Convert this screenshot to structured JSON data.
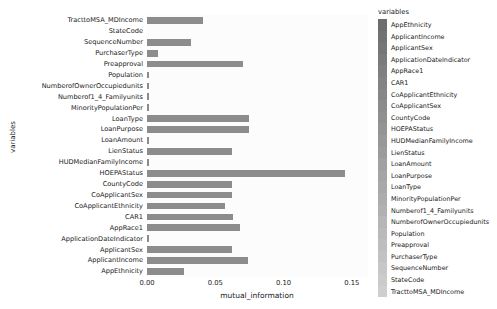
{
  "chart_data": {
    "type": "bar",
    "orientation": "horizontal",
    "title": "",
    "xlabel": "mutual_information",
    "ylabel": "variables",
    "xlim": [
      0.0,
      0.1618
    ],
    "grid": false,
    "legend_position": "right",
    "legend_title": "variables",
    "xticks": [
      "0.00",
      "0.05",
      "0.10",
      "0.15"
    ],
    "xtick_values": [
      0.0,
      0.05,
      0.1,
      0.15
    ],
    "bar_color": "#8c8c8c",
    "categories": [
      "TracttoMSA_MDIncome",
      "StateCode",
      "SequenceNumber",
      "PurchaserType",
      "Preapproval",
      "Population",
      "NumberofOwnerOccupiedunits",
      "Numberof1_4_Familyunits",
      "MinorityPopulationPer",
      "LoanType",
      "LoanPurpose",
      "LoanAmount",
      "LienStatus",
      "HUDMedianFamilyIncome",
      "HOEPAStatus",
      "CountyCode",
      "CoApplicantSex",
      "CoApplicantEthnicity",
      "CAR1",
      "AppRace1",
      "ApplicationDateIndicator",
      "ApplicantSex",
      "ApplicantIncome",
      "AppEthnicity"
    ],
    "values": [
      0.041,
      0.0,
      0.032,
      0.008,
      0.07,
      0.0012,
      0.0012,
      0.0012,
      0.0012,
      0.075,
      0.075,
      0.0013,
      0.062,
      0.0015,
      0.145,
      0.062,
      0.062,
      0.057,
      0.063,
      0.068,
      0.0013,
      0.062,
      0.074,
      0.027
    ]
  },
  "legend": {
    "title": "variables",
    "items": [
      "AppEthnicity",
      "ApplicantIncome",
      "ApplicantSex",
      "ApplicationDateIndicator",
      "AppRace1",
      "CAR1",
      "CoApplicantEthnicity",
      "CoApplicantSex",
      "CountyCode",
      "HOEPAStatus",
      "HUDMedianFamilyIncome",
      "LienStatus",
      "LoanAmount",
      "LoanPurpose",
      "LoanType",
      "MinorityPopulationPer",
      "Numberof1_4_Familyunits",
      "NumberofOwnerOccupiedunits",
      "Population",
      "Preapproval",
      "PurchaserType",
      "SequenceNumber",
      "StateCode",
      "TracttoMSA_MDIncome"
    ],
    "swatch_start_color": "#6e6e6e",
    "swatch_end_color": "#cfcfcf"
  }
}
